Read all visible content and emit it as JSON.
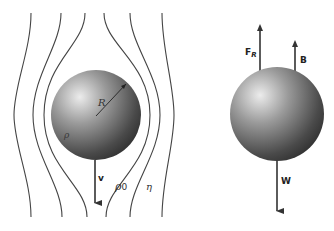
{
  "diagram": {
    "left_panel": {
      "description": "Sphere moving downward through fluid with streamlines",
      "labels": {
        "radius": "R",
        "sphere_density": "ρ",
        "velocity": "v",
        "fluid_density": "ρ",
        "fluid_density_sub": "0",
        "viscosity": "η"
      },
      "streamline_count": 6
    },
    "right_panel": {
      "description": "Free-body diagram of sphere",
      "forces": [
        {
          "name": "drag",
          "label": "F",
          "sub": "R",
          "direction": "up"
        },
        {
          "name": "buoyancy",
          "label": "B",
          "direction": "up"
        },
        {
          "name": "weight",
          "label": "W",
          "direction": "down"
        }
      ]
    },
    "colors": {
      "line": "#333333",
      "sphere_highlight": "#e8e8e8",
      "sphere_mid": "#8a8a8a",
      "sphere_shadow": "#2e2e2e",
      "background": "#ffffff"
    }
  }
}
